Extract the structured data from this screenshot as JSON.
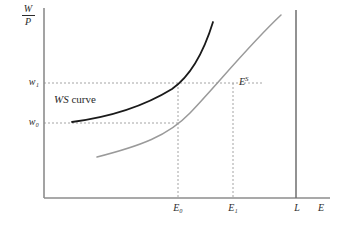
{
  "figure": {
    "background_color": "#ffffff"
  },
  "axes": {
    "y_axis_label_numerator": "W",
    "y_axis_label_denominator": "P",
    "x_axis_label": "E",
    "axis_color": "#8c8c8c",
    "origin": {
      "x": 44,
      "y": 198
    },
    "x_end": 330,
    "y_top": 8
  },
  "y_ticks": [
    {
      "name": "w1",
      "label": "w",
      "subscript": "1",
      "pixel_y": 83,
      "value": "w₁"
    },
    {
      "name": "w0",
      "label": "w",
      "subscript": "0",
      "pixel_y": 123,
      "value": "w₀"
    }
  ],
  "x_ticks": [
    {
      "name": "E0",
      "label": "E",
      "subscript": "0",
      "pixel_x": 178,
      "value": "E₀"
    },
    {
      "name": "E1",
      "label": "E",
      "subscript": "1",
      "pixel_x": 233,
      "value": "E₁"
    },
    {
      "name": "L",
      "label": "L",
      "subscript": "",
      "pixel_x": 296,
      "value": "L"
    }
  ],
  "curves": [
    {
      "name": "ws-curve",
      "label": "WS curve",
      "label_italic_part": "WS",
      "label_roman_part": " curve",
      "color": "#1a1a1a",
      "stroke_width": 1.8,
      "description": "Upward sloping convex wage-setting curve",
      "start": {
        "x": 72,
        "y": 122
      },
      "end": {
        "x": 213,
        "y": 22
      },
      "passes_through": [
        {
          "x": 178,
          "y": 83,
          "note": "E0 at w1"
        }
      ]
    },
    {
      "name": "labour-supply-curve",
      "label": "E",
      "label_superscript": "S",
      "color": "#9a9a9a",
      "stroke_width": 1.5,
      "description": "Upward sloping convex labour supply curve",
      "start": {
        "x": 97,
        "y": 157
      },
      "end": {
        "x": 281,
        "y": 15
      },
      "passes_through": [
        {
          "x": 178,
          "y": 123,
          "note": "E0 at w0"
        },
        {
          "x": 233,
          "y": 83,
          "note": "E1 at w1"
        }
      ]
    }
  ],
  "vertical_line": {
    "name": "labour-force-line",
    "label": "L",
    "pixel_x": 296,
    "color": "#6e6e6e",
    "description": "Vertical line at total labour force L"
  },
  "guide_lines": {
    "color": "#9a9a9a",
    "dash": "2,2",
    "horizontal": [
      {
        "name": "w1-guide",
        "y": 83,
        "from_x": 44,
        "to_x": 262
      },
      {
        "name": "w0-guide",
        "y": 123,
        "from_x": 44,
        "to_x": 180
      }
    ],
    "vertical": [
      {
        "name": "E0-guide",
        "x": 178,
        "from_y": 83,
        "to_y": 198
      },
      {
        "name": "E1-guide",
        "x": 233,
        "from_y": 83,
        "to_y": 198
      }
    ]
  }
}
